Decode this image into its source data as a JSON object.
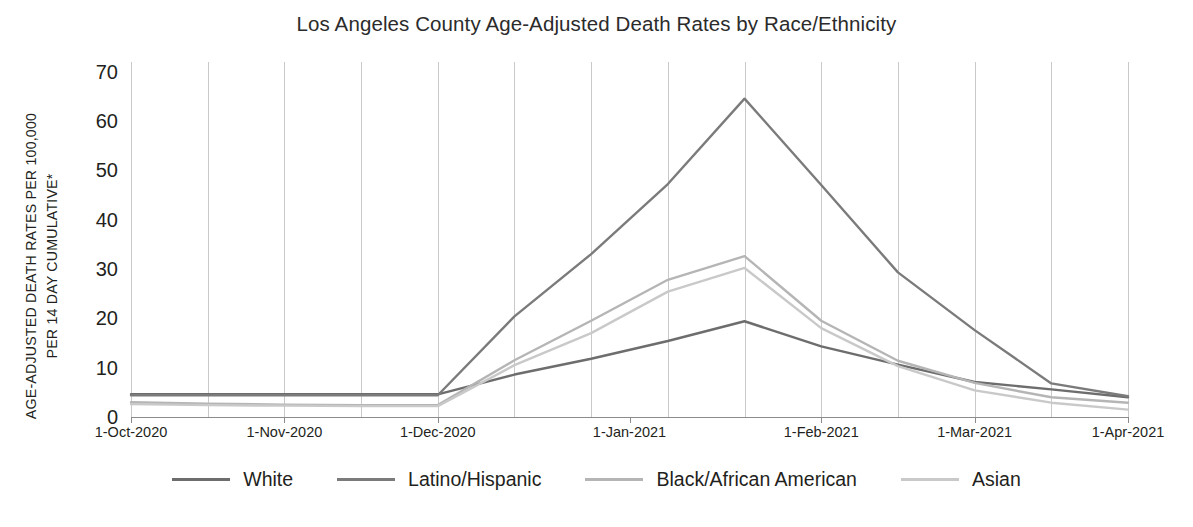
{
  "chart_data": {
    "type": "line",
    "title": "Los Angeles County Age-Adjusted Death Rates by Race/Ethnicity",
    "xlabel": "",
    "ylabel": "AGE-ADJUSTED DEATH RATES PER 100,000 PER 14 DAY CUMULATIVE*",
    "ylabel_line1": "AGE-ADJUSTED DEATH RATES PER 100,000",
    "ylabel_line2": "PER 14 DAY CUMULATIVE*",
    "ylim": [
      0,
      70
    ],
    "yticks": [
      0,
      10,
      20,
      30,
      40,
      50,
      60,
      70
    ],
    "grid": "vertical",
    "legend_position": "bottom",
    "x": [
      "1-Oct-2020",
      "15-Oct-2020",
      "29-Oct-2020",
      "12-Nov-2020",
      "26-Nov-2020",
      "10-Dec-2020",
      "24-Dec-2020",
      "7-Jan-2021",
      "21-Jan-2021",
      "4-Feb-2021",
      "18-Feb-2021",
      "4-Mar-2021",
      "18-Mar-2021",
      "1-Apr-2021"
    ],
    "xtick_labels": [
      "1-Oct-2020",
      "1-Nov-2020",
      "1-Dec-2020",
      "1-Jan-2021",
      "1-Feb-2021",
      "1-Mar-2021",
      "1-Apr-2021"
    ],
    "series": [
      {
        "name": "White",
        "color": "#6d6d6d",
        "values": [
          4.6,
          4.6,
          4.6,
          4.6,
          4.6,
          8.6,
          11.8,
          15.4,
          19.4,
          14.3,
          10.6,
          7.1,
          5.6,
          4.0
        ]
      },
      {
        "name": "Latino/Hispanic",
        "color": "#7b7b7b",
        "values": [
          4.4,
          4.4,
          4.4,
          4.4,
          4.4,
          20.4,
          33.0,
          47.2,
          64.5,
          47.0,
          29.3,
          17.6,
          6.8,
          4.2
        ]
      },
      {
        "name": "Black/African American",
        "color": "#b5b5b5",
        "values": [
          3.0,
          2.7,
          2.5,
          2.4,
          2.4,
          11.5,
          19.5,
          27.8,
          32.6,
          19.5,
          11.4,
          6.9,
          4.0,
          2.9
        ]
      },
      {
        "name": "Asian",
        "color": "#c9c9c9",
        "values": [
          2.6,
          2.4,
          2.3,
          2.2,
          2.2,
          10.5,
          17.0,
          25.4,
          30.2,
          18.0,
          10.3,
          5.4,
          2.9,
          1.5
        ]
      }
    ]
  },
  "legend": {
    "items": [
      {
        "label": "White",
        "color": "#6d6d6d"
      },
      {
        "label": "Latino/Hispanic",
        "color": "#7b7b7b"
      },
      {
        "label": "Black/African American",
        "color": "#b5b5b5"
      },
      {
        "label": "Asian",
        "color": "#c9c9c9"
      }
    ]
  }
}
